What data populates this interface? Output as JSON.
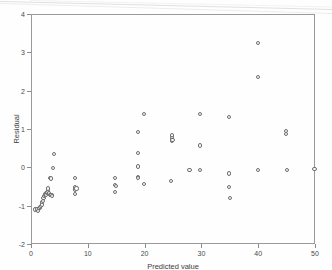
{
  "figure": {
    "background_color": "#fefefe",
    "marker_color": "#6d6d6d",
    "axis_color": "#9a9a9a",
    "text_color": "#3d3d3d"
  },
  "chart_data": {
    "type": "scatter",
    "title": "",
    "subtitle": "",
    "xlabel": "Predicted value",
    "ylabel": "Residual",
    "xlim": [
      0,
      50
    ],
    "ylim": [
      -2,
      4
    ],
    "xticks": [
      0,
      10,
      20,
      30,
      40,
      50
    ],
    "xtick_labels": [
      "0",
      "10",
      "20",
      "30",
      "40",
      "50"
    ],
    "yticks": [
      -2,
      -1,
      0,
      1,
      2,
      3,
      4
    ],
    "ytick_labels": [
      "-2",
      "-1",
      "0",
      "1",
      "2",
      "3",
      "4"
    ],
    "grid": false,
    "legend": null,
    "legend_position": "none",
    "marker": "open-circle",
    "series": [
      {
        "name": "residuals",
        "x": [
          0.8,
          1.0,
          1.1,
          1.3,
          1.5,
          1.6,
          1.8,
          1.9,
          2.0,
          2.1,
          2.2,
          2.3,
          2.4,
          2.5,
          2.6,
          2.7,
          2.8,
          2.9,
          3.0,
          3.0,
          3.1,
          3.2,
          3.3,
          3.4,
          3.5,
          3.6,
          3.7,
          3.9,
          4.0,
          7.8,
          7.8,
          7.8,
          7.8,
          8.0,
          14.8,
          14.8,
          14.8,
          15.0,
          18.8,
          18.8,
          18.8,
          18.8,
          18.9,
          19.9,
          19.9,
          24.6,
          24.8,
          24.8,
          24.8,
          24.9,
          27.9,
          29.8,
          29.8,
          29.8,
          34.8,
          34.9,
          34.9,
          35.0,
          39.9,
          39.9,
          40.0,
          44.9,
          44.9,
          45.0,
          49.9
        ],
        "y": [
          -1.1,
          -1.12,
          -1.08,
          -1.13,
          -1.06,
          -1.04,
          -1.01,
          -0.97,
          -0.9,
          -0.87,
          -0.79,
          -0.75,
          -0.73,
          -0.7,
          -0.68,
          -0.72,
          -0.66,
          -0.64,
          -0.62,
          -0.55,
          -0.7,
          -0.66,
          -0.72,
          -0.28,
          -0.29,
          -0.72,
          -0.74,
          -0.01,
          0.35,
          -0.28,
          -0.52,
          -0.58,
          -0.7,
          -0.55,
          -0.27,
          -0.46,
          -0.64,
          -0.48,
          0.93,
          0.38,
          0.02,
          -0.26,
          -0.28,
          1.39,
          -0.44,
          -0.36,
          0.83,
          0.76,
          0.7,
          0.72,
          -0.07,
          1.4,
          0.57,
          -0.08,
          1.32,
          -0.16,
          -0.52,
          -0.81,
          3.25,
          2.35,
          -0.07,
          0.94,
          0.88,
          -0.06,
          -0.05
        ]
      }
    ]
  }
}
